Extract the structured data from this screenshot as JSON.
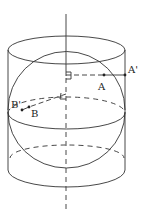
{
  "diagram": {
    "labels": {
      "a": "A",
      "a_prime": "A'",
      "b": "B",
      "b_prime": "B'"
    },
    "colors": {
      "stroke": "#333333",
      "background": "#ffffff"
    }
  }
}
